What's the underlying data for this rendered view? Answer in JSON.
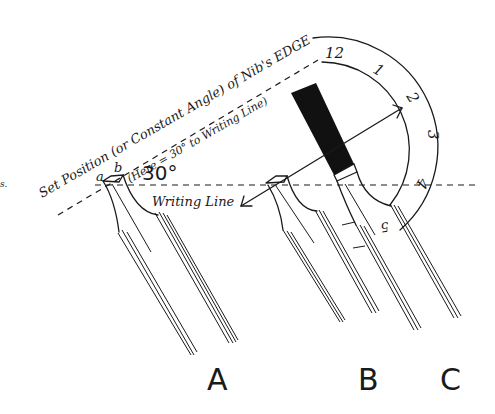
{
  "diagram": {
    "title_line1": "Set Position (or Constant Angle) of Nib's EDGE",
    "title_line2": "(Here = 30° to Writing Line)",
    "angle_label": "30°",
    "writing_line_label": "Writing Line",
    "edge_labels": {
      "a": "a",
      "b": "b"
    },
    "stray_mark": "s.",
    "clock_numbers": [
      "12",
      "1",
      "2",
      "3",
      "4",
      "5"
    ],
    "nib_labels": [
      "A",
      "B",
      "C"
    ],
    "colors": {
      "ink": "#1a1a1a",
      "background": "#ffffff",
      "fill": "#111111"
    }
  }
}
